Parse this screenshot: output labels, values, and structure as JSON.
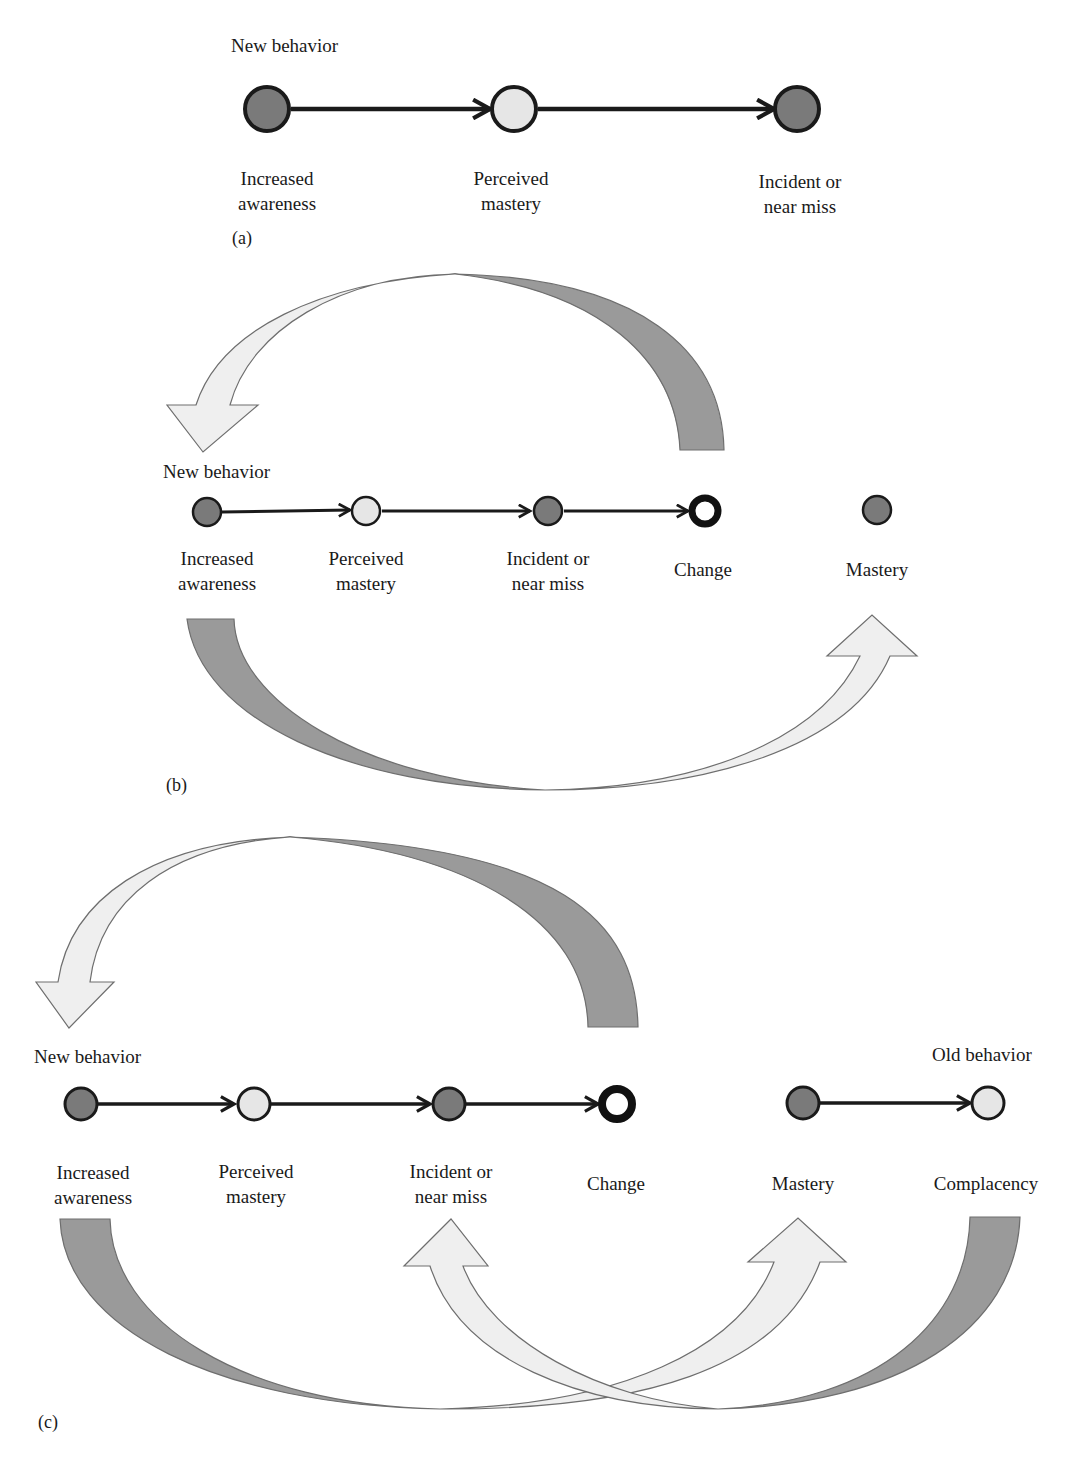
{
  "colors": {
    "node_dark": "#7a7a7a",
    "node_light": "#e6e6e6",
    "arrow_dark": "#9a9a9a",
    "arrow_light": "#efefef",
    "stroke": "#1a1a1a",
    "arrow_outline": "#6e6e6e"
  },
  "panels": [
    {
      "id": "a",
      "tag": "(a)",
      "header_left": "New behavior",
      "nodes": [
        {
          "label_line1": "Increased",
          "label_line2": "awareness",
          "fill": "dark"
        },
        {
          "label_line1": "Perceived",
          "label_line2": "mastery",
          "fill": "light"
        },
        {
          "label_line1": "Incident or",
          "label_line2": "near miss",
          "fill": "dark"
        }
      ]
    },
    {
      "id": "b",
      "tag": "(b)",
      "header_left": "New behavior",
      "nodes": [
        {
          "label_line1": "Increased",
          "label_line2": "awareness",
          "fill": "dark"
        },
        {
          "label_line1": "Perceived",
          "label_line2": "mastery",
          "fill": "light"
        },
        {
          "label_line1": "Incident or",
          "label_line2": "near miss",
          "fill": "dark"
        },
        {
          "label_line1": "Change",
          "label_line2": "",
          "fill": "ring"
        },
        {
          "label_line1": "Mastery",
          "label_line2": "",
          "fill": "dark"
        }
      ],
      "curved_arrows": [
        {
          "from": "Change",
          "to": "Increased awareness",
          "direction": "over-top"
        },
        {
          "from": "Increased awareness",
          "to": "Mastery",
          "direction": "under-bottom"
        }
      ]
    },
    {
      "id": "c",
      "tag": "(c)",
      "header_left": "New behavior",
      "header_right": "Old behavior",
      "nodes": [
        {
          "label_line1": "Increased",
          "label_line2": "awareness",
          "fill": "dark"
        },
        {
          "label_line1": "Perceived",
          "label_line2": "mastery",
          "fill": "light"
        },
        {
          "label_line1": "Incident or",
          "label_line2": "near miss",
          "fill": "dark"
        },
        {
          "label_line1": "Change",
          "label_line2": "",
          "fill": "ring"
        },
        {
          "label_line1": "Mastery",
          "label_line2": "",
          "fill": "dark"
        },
        {
          "label_line1": "Complacency",
          "label_line2": "",
          "fill": "light"
        }
      ],
      "curved_arrows": [
        {
          "from": "Change",
          "to": "Increased awareness",
          "direction": "over-top"
        },
        {
          "from": "Increased awareness",
          "to": "Mastery",
          "direction": "under-bottom"
        },
        {
          "from": "Complacency",
          "to": "Incident or near miss",
          "direction": "under-bottom"
        }
      ]
    }
  ]
}
